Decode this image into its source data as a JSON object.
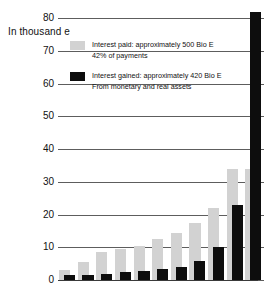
{
  "chart_data": {
    "type": "bar",
    "title": "",
    "subtitle": "",
    "ylabel": "In thousand e",
    "xlabel": "",
    "ylim": [
      0,
      80
    ],
    "yticks": [
      0,
      10,
      20,
      30,
      40,
      50,
      60,
      70,
      80
    ],
    "ytick_labels": [
      "0",
      "10",
      "20",
      "30",
      "40",
      "50",
      "60",
      "70",
      "80"
    ],
    "grid": true,
    "legend_position": "inside-top-left",
    "categories": [
      "1",
      "2",
      "3",
      "4",
      "5",
      "6",
      "7",
      "8",
      "9",
      "10",
      "11"
    ],
    "series": [
      {
        "name": "Interest paid: approximately 500 Bio E",
        "color": "#d2d2d2",
        "values": [
          3,
          5.5,
          8.5,
          9.5,
          10.5,
          12.5,
          14.5,
          17.5,
          22,
          34,
          34
        ]
      },
      {
        "name": "Interest gained: approximately 420 Bio E",
        "color": "#0d0d0d",
        "values": [
          1.5,
          1.5,
          1.8,
          2.3,
          2.8,
          3.3,
          4,
          5.8,
          10,
          23,
          86
        ]
      }
    ],
    "legend": [
      {
        "swatch": "#d2d2d2",
        "line1": "Interest paid: approximately 500 Bio E",
        "line2": "42% of payments"
      },
      {
        "swatch": "#0d0d0d",
        "line1": "Interest gained: approximately 420 Bio E",
        "line2": "From monetary and real assets"
      }
    ]
  },
  "colors": {
    "paid": "#d2d2d2",
    "gained": "#0d0d0d",
    "grid": "#5d5d5d",
    "text": "#111111",
    "background": "#ffffff"
  }
}
